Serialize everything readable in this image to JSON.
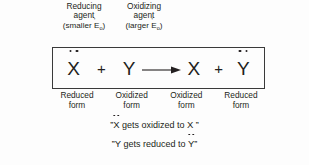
{
  "diagram": {
    "agents": [
      {
        "line1": "Reducing",
        "line2": "agent",
        "paren_open": "(smaller ",
        "e_base": "E",
        "e_prime": "'",
        "e_sub": "o",
        "paren_close": ")"
      },
      {
        "line1": "Oxidizing",
        "line2": "agent",
        "paren_open": "(larger ",
        "e_base": "E",
        "e_prime": "'",
        "e_sub": "o",
        "paren_close": ")"
      }
    ],
    "equation": {
      "reactant_1": "X",
      "reactant_1_dots": 2,
      "operator_1": "+",
      "reactant_2": "Y",
      "reactant_2_dots": 0,
      "arrow": "reaction-arrow-right",
      "product_1": "X",
      "product_1_dots": 0,
      "operator_2": "+",
      "product_2": "Y",
      "product_2_dots": 2
    },
    "forms": [
      {
        "line1": "Reduced",
        "line2": "form"
      },
      {
        "line1": "Oxidized",
        "line2": "form"
      },
      {
        "line1": "Oxidized",
        "line2": "form"
      },
      {
        "line1": "Reduced",
        "line2": "form"
      }
    ],
    "statements": [
      {
        "quote_open": "”",
        "subject": "X",
        "subject_dots": 2,
        "text": " gets oxidized to ",
        "object": "X",
        "object_dots": 0,
        "quote_close": " ”"
      },
      {
        "quote_open": "”",
        "subject": "Y",
        "subject_dots": 0,
        "text": " gets reduced to ",
        "object": "Y",
        "object_dots": 2,
        "quote_close": "”"
      }
    ],
    "colors": {
      "ink": "#231f20",
      "border": "#3a3a3a",
      "background": "#fdfdfd"
    }
  }
}
